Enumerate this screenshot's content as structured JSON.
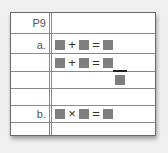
{
  "worksheet": {
    "header_label": "P9",
    "rows": [
      {
        "label": "a.",
        "equation": {
          "operator": "+",
          "equals": "="
        }
      },
      {
        "label": "",
        "equation": {
          "operator": "+",
          "equals": "="
        },
        "fraction": true
      },
      {
        "label": "",
        "equation": null
      },
      {
        "label": "b.",
        "equation": {
          "operator": "×",
          "equals": "="
        }
      }
    ],
    "colors": {
      "blank_box": "#7f7f7f",
      "line": "#8a8a8a",
      "label_text": "#555555"
    }
  }
}
